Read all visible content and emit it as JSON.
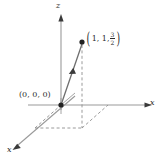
{
  "figure": {
    "type": "3d-coordinate-vector-diagram",
    "background_color": "#ffffff",
    "line_color": "#9a9a9a",
    "dash_color": "#8f8f8f",
    "text_color": "#2b2b2b",
    "axes": {
      "z_label": "z",
      "x_label": "x",
      "y_label": "x"
    },
    "labels": {
      "origin": "(0, 0, 0)",
      "point_open_paren": "(",
      "point_coords": "1, 1,",
      "point_frac_numerator": "3",
      "point_frac_denominator": "2",
      "point_close_paren": ")"
    },
    "geometry": {
      "origin_px": [
        61,
        105
      ],
      "point_px": [
        82,
        42
      ],
      "x_axis_end_px": [
        148,
        105
      ],
      "z_axis_top_px": [
        61,
        18
      ],
      "y_axis_end_px": [
        14,
        148
      ],
      "foot_px": [
        82,
        105
      ],
      "projection_px": [
        82,
        128
      ],
      "y_corner_px": [
        35,
        128
      ],
      "x_corner_px": [
        108,
        105
      ]
    }
  }
}
